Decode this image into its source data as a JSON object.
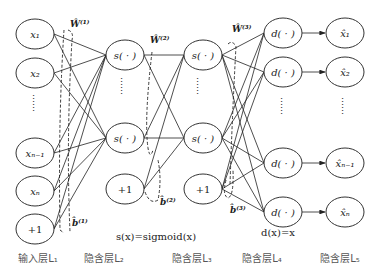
{
  "diagram": {
    "title": "",
    "layers": [
      {
        "label": "输入层L₁",
        "x": 38,
        "nodes": [
          "x₁",
          "x₂",
          "……",
          "xₙ₋₁",
          "xₙ",
          "+1"
        ]
      },
      {
        "label": "隐含层L₂",
        "x": 108,
        "nodes": [
          "s(·)",
          "……",
          "s(·)",
          "+1"
        ]
      },
      {
        "label": "隐含层L₃",
        "x": 193,
        "nodes": [
          "s(·)",
          "……",
          "s(·)",
          "+1"
        ]
      },
      {
        "label": "隐含层L₄",
        "x": 262,
        "nodes": [
          "d(·)",
          "d(·)",
          "……",
          "d(·)",
          "d(·)"
        ]
      },
      {
        "label": "隐含层L₅",
        "x": 340,
        "nodes": [
          "x̂₁",
          "x̂₂",
          "……",
          "x̂ₙ₋₁",
          "x̂ₙ"
        ]
      }
    ],
    "weights": {
      "w1": "Ŵ⁽¹⁾",
      "w2": "Ŵ⁽²⁾",
      "w3": "Ŵ⁽³⁾",
      "b1": "b̂⁽¹⁾",
      "b2": "b̂⁽²⁾",
      "b3": "b̂⁽³⁾"
    },
    "formulas": {
      "sigmoid": "s(x)=sigmoid(x)",
      "identity": "d(x)=x"
    },
    "node_labels": {
      "l1": [
        "x₁",
        "x₂",
        "xₙ₋₁",
        "xₙ",
        "+1"
      ],
      "l2": [
        "s( · )",
        "s( · )",
        "+1"
      ],
      "l3": [
        "s( · )",
        "s( · )",
        "+1"
      ],
      "l4": [
        "d( · )",
        "d( · )",
        "d( · )",
        "d( · )"
      ],
      "l5": [
        "x̂₁",
        "x̂₂",
        "x̂ₙ₋₁",
        "x̂ₙ"
      ]
    },
    "ellipsis": "……"
  }
}
